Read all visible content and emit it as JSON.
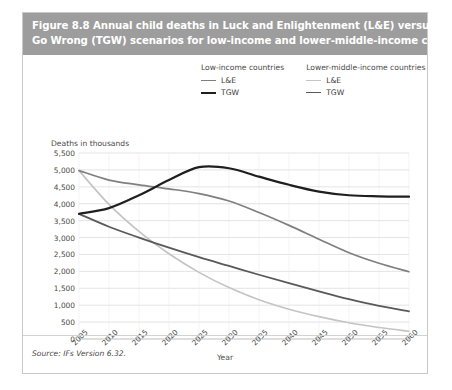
{
  "figure": {
    "title_line1": "Figure 8.8 Annual child deaths in Luck and Enlightenment (L&E) versus Things",
    "title_line2": "Go Wrong (TGW) scenarios for low-income and lower-middle-income countries",
    "source": "Source: IFs Version 6.32.",
    "title_bar_color": "#9d9d9d",
    "panel_color": "#ffffff",
    "border_color": "#c9c9c9"
  },
  "legend": {
    "groups": [
      {
        "heading": "Low-income countries",
        "entries": [
          {
            "label": "L&E",
            "color": "#7f7f7f",
            "width": 1.6
          },
          {
            "label": "TGW",
            "color": "#1f1f1f",
            "width": 2.2
          }
        ]
      },
      {
        "heading": "Lower-middle-income countries",
        "entries": [
          {
            "label": "L&E",
            "color": "#c4c4c4",
            "width": 1.6
          },
          {
            "label": "TGW",
            "color": "#595959",
            "width": 1.8
          }
        ]
      }
    ]
  },
  "chart_data": {
    "type": "line",
    "title": "Annual child deaths in Luck and Enlightenment (L&E) versus Things Go Wrong (TGW) scenarios for low-income and lower-middle-income countries",
    "xlabel": "Year",
    "ylabel": "Deaths in thousands",
    "xlim": [
      2005,
      2060
    ],
    "ylim": [
      0,
      5500
    ],
    "ytick_step": 500,
    "xtick_step": 5,
    "grid": true,
    "legend_position": "top",
    "xticks": [
      2005,
      2010,
      2015,
      2020,
      2025,
      2030,
      2035,
      2040,
      2045,
      2050,
      2055,
      2060
    ],
    "ytick_labels": [
      "5,500",
      "5,000",
      "4,500",
      "4,000",
      "3,500",
      "3,000",
      "2,500",
      "2,000",
      "1,500",
      "1,000",
      "500",
      "0"
    ],
    "yticks": [
      5500,
      5000,
      4500,
      4000,
      3500,
      3000,
      2500,
      2000,
      1500,
      1000,
      500,
      0
    ],
    "x": [
      2005,
      2010,
      2015,
      2020,
      2025,
      2030,
      2035,
      2040,
      2045,
      2050,
      2055,
      2060
    ],
    "series": [
      {
        "name": "TGW",
        "group": "Low-income countries",
        "color": "#1f1f1f",
        "width": 2.2,
        "values": [
          3700,
          3870,
          4250,
          4700,
          5080,
          5050,
          4800,
          4560,
          4360,
          4250,
          4220,
          4210
        ]
      },
      {
        "name": "L&E",
        "group": "Low-income countries",
        "color": "#7f7f7f",
        "width": 1.7,
        "values": [
          4980,
          4700,
          4560,
          4440,
          4300,
          4080,
          3740,
          3360,
          2950,
          2550,
          2240,
          1990
        ]
      },
      {
        "name": "TGW",
        "group": "Lower-middle-income countries",
        "color": "#595959",
        "width": 1.8,
        "values": [
          3700,
          3320,
          3000,
          2700,
          2420,
          2160,
          1900,
          1650,
          1410,
          1180,
          980,
          820
        ]
      },
      {
        "name": "L&E",
        "group": "Lower-middle-income countries",
        "color": "#c4c4c4",
        "width": 1.7,
        "values": [
          4980,
          3980,
          3180,
          2520,
          1970,
          1520,
          1160,
          880,
          660,
          480,
          340,
          230
        ]
      }
    ]
  }
}
